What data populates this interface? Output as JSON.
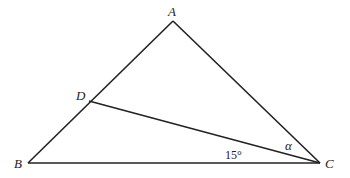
{
  "diagram": {
    "type": "geometry",
    "stroke_color": "#222222",
    "background": "#ffffff",
    "points": {
      "A": {
        "label": "A",
        "x": 173,
        "y": 21
      },
      "B": {
        "label": "B",
        "x": 28,
        "y": 163
      },
      "C": {
        "label": "C",
        "x": 320,
        "y": 163
      },
      "D": {
        "label": "D",
        "x": 89,
        "y": 101
      }
    },
    "segments": [
      {
        "from": "A",
        "to": "B"
      },
      {
        "from": "A",
        "to": "C"
      },
      {
        "from": "B",
        "to": "C"
      },
      {
        "from": "D",
        "to": "C"
      }
    ],
    "angles": {
      "DCB": {
        "label": "15°"
      },
      "ACD": {
        "label": "α"
      }
    }
  }
}
